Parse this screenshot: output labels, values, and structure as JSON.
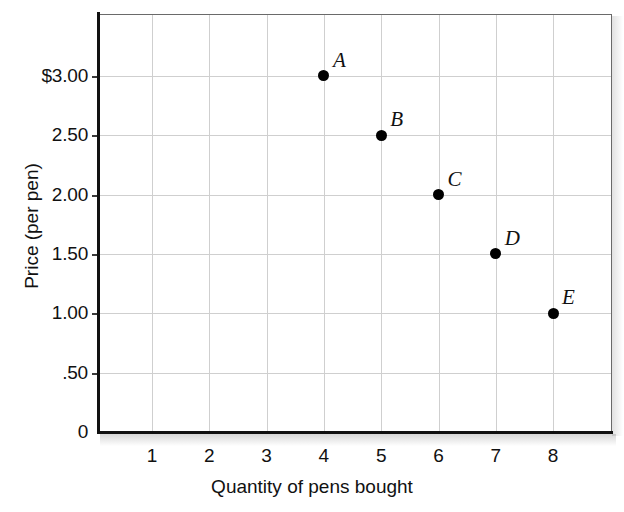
{
  "chart_data": {
    "type": "scatter",
    "title": "",
    "xlabel": "Quantity of pens bought",
    "ylabel": "Price (per pen)",
    "xlim": [
      0,
      9
    ],
    "ylim": [
      0,
      3.5
    ],
    "grid": true,
    "legend": "none",
    "x_ticks": [
      "1",
      "2",
      "3",
      "4",
      "5",
      "6",
      "7",
      "8"
    ],
    "x_tick_values": [
      1,
      2,
      3,
      4,
      5,
      6,
      7,
      8
    ],
    "y_ticks": [
      "0",
      ".50",
      "1.00",
      "1.50",
      "2.00",
      "2.50",
      "$3.00"
    ],
    "y_tick_values": [
      0,
      0.5,
      1.0,
      1.5,
      2.0,
      2.5,
      3.0
    ],
    "point_labels": [
      "A",
      "B",
      "C",
      "D",
      "E"
    ],
    "x": [
      4,
      5,
      6,
      7,
      8
    ],
    "values": [
      3.0,
      2.5,
      2.0,
      1.5,
      1.0
    ],
    "points": [
      {
        "label": "A",
        "x": 4,
        "y": 3.0
      },
      {
        "label": "B",
        "x": 5,
        "y": 2.5
      },
      {
        "label": "C",
        "x": 6,
        "y": 2.0
      },
      {
        "label": "D",
        "x": 7,
        "y": 1.5
      },
      {
        "label": "E",
        "x": 8,
        "y": 1.0
      }
    ],
    "colors": {
      "marker": "#000000",
      "axis": "#111111",
      "grid": "#cfcfcf",
      "background": "#ffffff"
    }
  }
}
